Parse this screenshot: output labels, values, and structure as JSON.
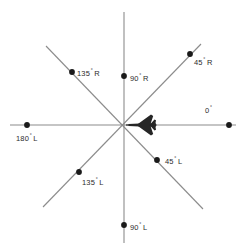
{
  "diagram": {
    "type": "polar-bearing-reference",
    "center_icon": "aircraft-icon",
    "center_icon_heading": "left",
    "axis_color": "#8c8c8c",
    "dot_color": "#1a1a1a",
    "label_color": "#2b2b2b",
    "background": "#ffffff",
    "degree_symbol": "°",
    "bearings": [
      {
        "id": "0",
        "number": "0",
        "degree": "°",
        "side": "",
        "angle_deg": 0
      },
      {
        "id": "45R",
        "number": "45",
        "degree": "°",
        "side": "R",
        "angle_deg": 45
      },
      {
        "id": "90R",
        "number": "90",
        "degree": "°",
        "side": "R",
        "angle_deg": 90
      },
      {
        "id": "135R",
        "number": "135",
        "degree": "°",
        "side": "R",
        "angle_deg": 135
      },
      {
        "id": "180L",
        "number": "180",
        "degree": "°",
        "side": "L",
        "angle_deg": 180
      },
      {
        "id": "135L",
        "number": "135",
        "degree": "°",
        "side": "L",
        "angle_deg": 225
      },
      {
        "id": "90L",
        "number": "90",
        "degree": "°",
        "side": "L",
        "angle_deg": 270
      },
      {
        "id": "45L",
        "number": "45",
        "degree": "°",
        "side": "L",
        "angle_deg": 315
      }
    ]
  }
}
